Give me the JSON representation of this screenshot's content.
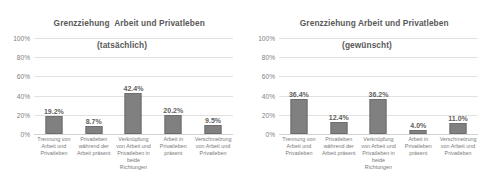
{
  "chart_data": [
    {
      "type": "bar",
      "title": "Grenzziehung  Arbeit und Privatleben",
      "subtitle": "(tatsächlich)",
      "xlabel": "",
      "ylabel": "",
      "ylim": [
        0,
        100
      ],
      "yticks": [
        "0%",
        "20%",
        "40%",
        "60%",
        "80%",
        "100%"
      ],
      "grid": true,
      "legend": "none",
      "bar_color": "#808080",
      "categories": [
        "Trennung von Arbeit und Privatleben",
        "Privatleben während der Arbeit präsent",
        "Verknüpfung von Arbeit und Privatleben in beide Richtungen",
        "Arbeit in Privatleben präsent",
        "Verschmelzung von Arbeit und Privatleben"
      ],
      "values": [
        19.2,
        8.7,
        42.4,
        20.2,
        9.5
      ],
      "data_labels": [
        "19.2%",
        "8.7%",
        "42.4%",
        "20.2%",
        "9.5%"
      ]
    },
    {
      "type": "bar",
      "title": "Grenzziehung Arbeit und Privatleben",
      "subtitle": "(gewünscht)",
      "xlabel": "",
      "ylabel": "",
      "ylim": [
        0,
        100
      ],
      "yticks": [
        "0%",
        "20%",
        "40%",
        "60%",
        "80%",
        "100%"
      ],
      "grid": true,
      "legend": "none",
      "bar_color": "#808080",
      "categories": [
        "Trennung von Arbeit und Privatleben",
        "Privatleben während der Arbeit präsent",
        "Verknüpfung von Arbeit und Privatleben in beide Richtungen",
        "Arbeit in Privatleben präsent",
        "Verschmelzung von Arbeit und Privatleben"
      ],
      "values": [
        36.4,
        12.4,
        36.2,
        4.0,
        11.0
      ],
      "data_labels": [
        "36.4%",
        "12.4%",
        "36.2%",
        "4.0%",
        "11.0%"
      ]
    }
  ]
}
